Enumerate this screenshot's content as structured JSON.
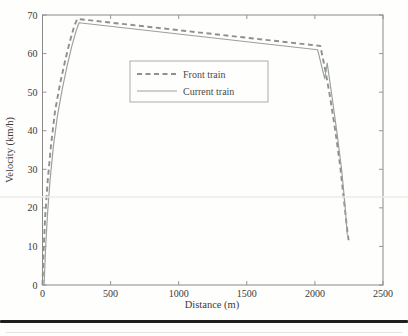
{
  "chart_data": {
    "type": "line",
    "title": "",
    "xlabel": "Distance (m)",
    "ylabel": "Velocity (km/h)",
    "xlim": [
      0,
      2500
    ],
    "ylim": [
      0,
      70
    ],
    "xticks": [
      0,
      500,
      1000,
      1500,
      2000,
      2500
    ],
    "yticks": [
      0,
      10,
      20,
      30,
      40,
      50,
      60,
      70
    ],
    "grid": "off",
    "frame": "box-with-inward-ticks-all-sides",
    "axis_color": "#8a8a8a",
    "legend": {
      "position": "upper-center-left-inside",
      "border_color": "#999999",
      "entries": [
        "Front train",
        "Current train"
      ]
    },
    "series": [
      {
        "name": "Front train",
        "style": "dashed",
        "color": "#8d918d",
        "width": 1.9,
        "points": [
          [
            0,
            0
          ],
          [
            8,
            9
          ],
          [
            20,
            18
          ],
          [
            38,
            27
          ],
          [
            62,
            36
          ],
          [
            92,
            45
          ],
          [
            128,
            52
          ],
          [
            165,
            58
          ],
          [
            200,
            63
          ],
          [
            232,
            67
          ],
          [
            255,
            69
          ],
          [
            2040,
            62
          ],
          [
            2075,
            56
          ],
          [
            2110,
            49
          ],
          [
            2150,
            40
          ],
          [
            2185,
            31
          ],
          [
            2213,
            22
          ],
          [
            2235,
            15
          ],
          [
            2250,
            11
          ]
        ]
      },
      {
        "name": "Current train",
        "style": "solid",
        "color": "#9aa09b",
        "width": 1.15,
        "points": [
          [
            12,
            0
          ],
          [
            22,
            9
          ],
          [
            36,
            18
          ],
          [
            55,
            27
          ],
          [
            80,
            36
          ],
          [
            110,
            44
          ],
          [
            146,
            51
          ],
          [
            182,
            57
          ],
          [
            216,
            62
          ],
          [
            248,
            66
          ],
          [
            268,
            68
          ],
          [
            2020,
            61
          ],
          [
            2072,
            53.5
          ],
          [
            2090,
            57.5
          ],
          [
            2125,
            49
          ],
          [
            2160,
            40
          ],
          [
            2196,
            30
          ],
          [
            2220,
            21
          ],
          [
            2238,
            13
          ]
        ]
      }
    ]
  }
}
